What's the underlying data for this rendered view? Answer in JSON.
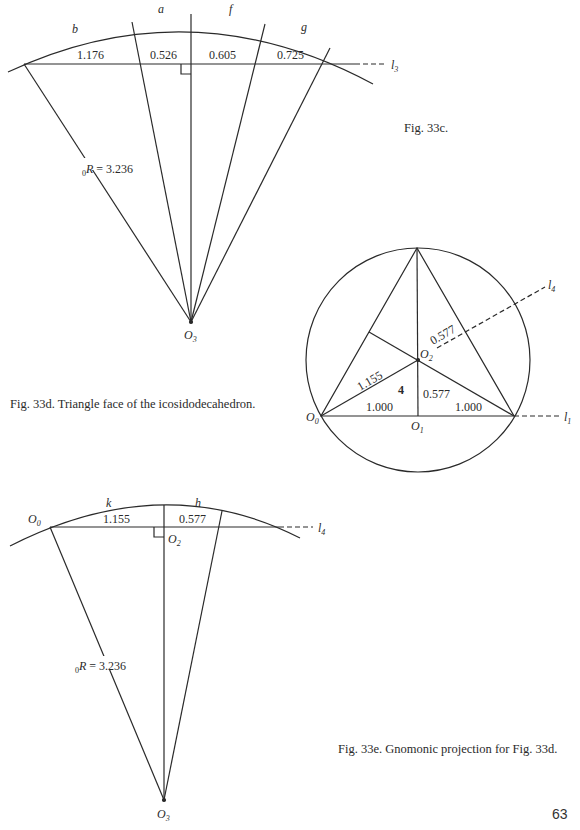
{
  "page": {
    "number": "63",
    "background": "#ffffff",
    "ink": "#2a2a2a"
  },
  "fig33c": {
    "caption": "Fig. 33c.",
    "arc_labels": [
      "b",
      "a",
      "f",
      "g"
    ],
    "segment_values": [
      "1.176",
      "0.526",
      "0.605",
      "0.725"
    ],
    "line_label": "l",
    "line_subscript": "3",
    "radius_prefix": "0",
    "radius_label": "R = 3.236",
    "center_label": "O",
    "center_subscript": "3"
  },
  "fig33d": {
    "caption": "Fig. 33d. Triangle face of the icosidodecahedron.",
    "labels": {
      "o0": "O",
      "o0_sub": "0",
      "o1": "O",
      "o1_sub": "1",
      "o2": "O",
      "o2_sub": "2",
      "l1": "l",
      "l1_sub": "1",
      "l4": "l",
      "l4_sub": "4",
      "face_number": "4"
    },
    "values": {
      "left_base": "1.000",
      "right_base": "1.000",
      "inradius_vertical": "0.577",
      "inradius_oblique": "0.577",
      "circumradius": "1.155"
    }
  },
  "fig33e": {
    "caption": "Fig. 33e. Gnomonic projection for Fig. 33d.",
    "arc_labels": [
      "k",
      "h"
    ],
    "segment_values": [
      "1.155",
      "0.577"
    ],
    "left_point": "O",
    "left_point_sub": "0",
    "foot_point": "O",
    "foot_point_sub": "2",
    "line_label": "l",
    "line_subscript": "4",
    "radius_prefix": "0",
    "radius_label": "R = 3.236",
    "center_label": "O",
    "center_subscript": "3"
  }
}
